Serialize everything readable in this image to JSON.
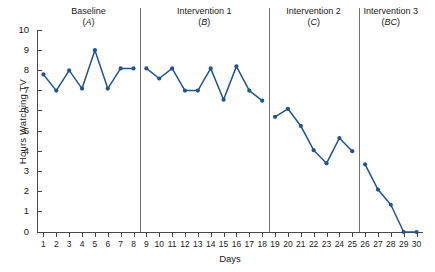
{
  "chart_data": {
    "type": "line",
    "title": "",
    "xlabel": "Days",
    "ylabel": "Hours Watching TV",
    "xlim": [
      0.5,
      30.5
    ],
    "ylim": [
      0,
      10
    ],
    "grid": false,
    "legend": "none",
    "line_color": "#1f5593",
    "marker": "circle",
    "x_tick_labels": [
      "1",
      "2",
      "3",
      "4",
      "5",
      "6",
      "7",
      "8",
      "9",
      "10",
      "11",
      "12",
      "13",
      "14",
      "15",
      "16",
      "17",
      "18",
      "19",
      "20",
      "21",
      "22",
      "23",
      "24",
      "25",
      "26",
      "27",
      "28",
      "29",
      "30"
    ],
    "y_tick_labels": [
      "0",
      "1",
      "2",
      "3",
      "4",
      "5",
      "6",
      "7",
      "8",
      "9",
      "10"
    ],
    "x": [
      1,
      2,
      3,
      4,
      5,
      6,
      7,
      8,
      9,
      10,
      11,
      12,
      13,
      14,
      15,
      16,
      17,
      18,
      19,
      20,
      21,
      22,
      23,
      24,
      25,
      26,
      27,
      28,
      29,
      30
    ],
    "values": [
      7.8,
      7.0,
      8.0,
      7.1,
      9.0,
      7.1,
      8.1,
      8.1,
      8.1,
      7.6,
      8.1,
      7.0,
      7.0,
      8.1,
      6.55,
      8.2,
      7.0,
      6.5,
      5.7,
      6.1,
      5.25,
      4.05,
      3.4,
      4.65,
      4.0,
      3.35,
      2.1,
      1.35,
      0.0,
      0.0
    ],
    "phases": [
      {
        "name": "Baseline",
        "condition": "A",
        "x_start": 1,
        "x_end": 8
      },
      {
        "name": "Intervention 1",
        "condition": "B",
        "x_start": 9,
        "x_end": 18
      },
      {
        "name": "Intervention 2",
        "condition": "C",
        "x_start": 19,
        "x_end": 25
      },
      {
        "name": "Intervention 3",
        "condition": "BC",
        "x_start": 26,
        "x_end": 30
      }
    ],
    "phase_dividers": [
      8.5,
      18.5,
      25.5
    ]
  }
}
